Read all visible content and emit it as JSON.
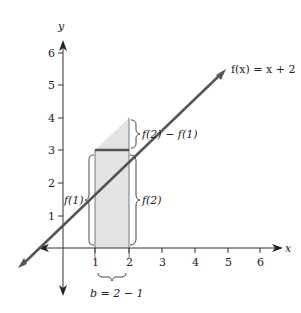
{
  "figure": {
    "function_label": "f(x) = x + 2",
    "axis_x_label": "x",
    "axis_y_label": "y",
    "x_ticks": [
      "1",
      "2",
      "3",
      "4",
      "5",
      "6"
    ],
    "y_ticks": [
      "1",
      "2",
      "3",
      "4",
      "5",
      "6"
    ],
    "brace_labels": {
      "f1": "f(1)",
      "f2": "f(2)",
      "diff": "f(2) − f(1)",
      "base": "b = 2 − 1"
    },
    "colors": {
      "line": "#555555",
      "shade": "#e3e3e3",
      "axis": "#333333"
    }
  }
}
